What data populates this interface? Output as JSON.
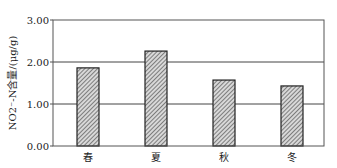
{
  "chart_data": {
    "type": "bar",
    "title": "",
    "xlabel": "",
    "ylabel": "NO2⁻-N含量/(μg/g)",
    "categories": [
      "春",
      "夏",
      "秋",
      "冬"
    ],
    "values": [
      1.86,
      2.26,
      1.57,
      1.43
    ],
    "ylim": [
      0,
      3
    ],
    "yticks": [
      "0.00",
      "1.00",
      "2.00",
      "3.00"
    ],
    "grid": true,
    "legend": null,
    "bar_fill": "hatched gray",
    "colors": {
      "bar_stroke": "#222222",
      "hatch": "#555555",
      "grid": "#444444"
    }
  }
}
